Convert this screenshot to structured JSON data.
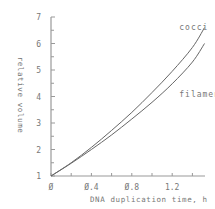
{
  "chart_data": {
    "type": "line",
    "title": "",
    "xlabel": "DNA duplication time, h",
    "ylabel": "relative volume",
    "xlim": [
      0,
      1.52
    ],
    "ylim": [
      1,
      7
    ],
    "x_ticks": [
      0,
      0.2,
      0.4,
      0.6,
      0.8,
      1.0,
      1.2,
      1.4
    ],
    "x_tick_labels": [
      "0",
      "0.4",
      "0.8",
      "1.2"
    ],
    "x_tick_label_values": [
      0,
      0.4,
      0.8,
      1.2
    ],
    "y_ticks": [
      1,
      1.5,
      2,
      2.5,
      3,
      3.5,
      4,
      4.5,
      5,
      5.5,
      6,
      6.5,
      7
    ],
    "y_tick_labels": [
      "1",
      "2",
      "3",
      "4",
      "5",
      "6",
      "7"
    ],
    "grid": false,
    "legend": "inline labels at line ends",
    "x": [
      0,
      0.2,
      0.4,
      0.6,
      0.8,
      1.0,
      1.2,
      1.4,
      1.52
    ],
    "series": [
      {
        "name": "cocci",
        "values": [
          1.0,
          1.5,
          2.08,
          2.72,
          3.4,
          4.15,
          4.95,
          5.85,
          6.6
        ]
      },
      {
        "name": "filaments",
        "values": [
          1.0,
          1.48,
          2.0,
          2.55,
          3.15,
          3.78,
          4.48,
          5.3,
          6.0
        ]
      }
    ],
    "annotations": [
      {
        "text": "cocci",
        "x": 1.27,
        "y": 6.5
      },
      {
        "text": "filaments",
        "x": 1.27,
        "y": 4.0
      }
    ]
  },
  "colors": {
    "axis": "#999999",
    "line": "#666666",
    "text": "#777777"
  }
}
